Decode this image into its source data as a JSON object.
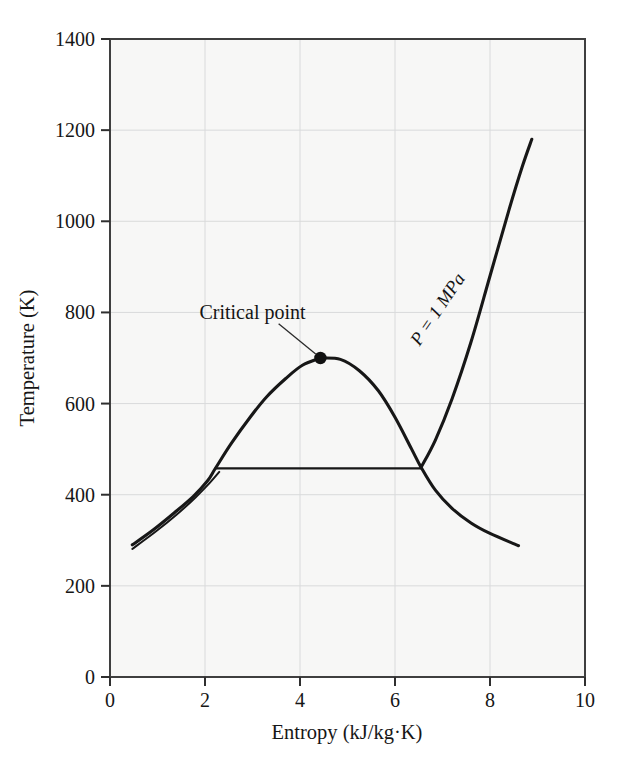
{
  "chart_data": {
    "type": "line",
    "title": "",
    "xlabel": "Entropy (kJ/kg·K)",
    "ylabel": "Temperature (K)",
    "xlim": [
      0,
      10
    ],
    "ylim": [
      0,
      1400
    ],
    "xticks": [
      "0",
      "2",
      "4",
      "6",
      "8",
      "10"
    ],
    "xtick_values": [
      0,
      2,
      4,
      6,
      8,
      10
    ],
    "yticks": [
      "0",
      "200",
      "400",
      "600",
      "800",
      "1000",
      "1200",
      "1400"
    ],
    "ytick_values": [
      0,
      200,
      400,
      600,
      800,
      1000,
      1200,
      1400
    ],
    "grid": true,
    "legend": "none",
    "annotations": [
      {
        "name": "critical-point",
        "text": "Critical point",
        "point": [
          4.43,
          700
        ],
        "label_at": [
          3.0,
          800
        ],
        "leader_from": [
          3.55,
          775
        ],
        "leader_to": [
          4.33,
          709
        ]
      },
      {
        "name": "pressure-line-label",
        "text": "P = 1 MPa",
        "label_at": [
          7.0,
          800
        ],
        "rotation_deg": -56
      }
    ],
    "series": [
      {
        "name": "Saturated liquid line",
        "style": "solid",
        "x": [
          0.47,
          0.9,
          1.35,
          1.75,
          2.05,
          2.22,
          2.55,
          2.95,
          3.3,
          3.7,
          4.05,
          4.43
        ],
        "y": [
          290,
          322,
          360,
          396,
          430,
          458,
          512,
          570,
          615,
          655,
          684,
          700
        ]
      },
      {
        "name": "Saturated vapor line",
        "style": "solid",
        "x": [
          4.43,
          4.85,
          5.25,
          5.65,
          6.0,
          6.35,
          6.55,
          6.85,
          7.2,
          7.6,
          8.0,
          8.6
        ],
        "y": [
          700,
          697,
          672,
          628,
          570,
          500,
          460,
          410,
          370,
          338,
          315,
          288
        ]
      },
      {
        "name": "Constant pressure line P = 1 MPa (saturation segment)",
        "style": "solid",
        "x": [
          2.22,
          3.2,
          4.2,
          5.2,
          6.0,
          6.55
        ],
        "y": [
          458,
          458,
          458,
          458,
          458,
          458
        ]
      },
      {
        "name": "Constant pressure line P = 1 MPa (superheat segment)",
        "style": "solid",
        "x": [
          6.55,
          6.85,
          7.2,
          7.6,
          8.0,
          8.4,
          8.68,
          8.88
        ],
        "y": [
          460,
          520,
          610,
          735,
          880,
          1025,
          1120,
          1180
        ]
      },
      {
        "name": "Compressed liquid line",
        "style": "solid",
        "x": [
          0.47,
          0.95,
          1.4,
          1.8,
          2.1,
          2.3
        ],
        "y": [
          281,
          318,
          356,
          394,
          426,
          450
        ]
      }
    ]
  },
  "axes": {
    "x_tick_labels": [
      "0",
      "2",
      "4",
      "6",
      "8",
      "10"
    ],
    "y_tick_labels": [
      "0",
      "200",
      "400",
      "600",
      "800",
      "1000",
      "1200",
      "1400"
    ],
    "x_axis_title": "Entropy (kJ/kg·K)",
    "y_axis_title": "Temperature (K)"
  },
  "labels": {
    "critical_point": "Critical point",
    "pressure": "P = 1 MPa"
  },
  "colors": {
    "plot_background": "#f7f7f6",
    "frame": "#3a3a3a",
    "gridline": "#d9dadb",
    "curve": "#171717",
    "text": "#161616",
    "page_background": "#ffffff"
  }
}
